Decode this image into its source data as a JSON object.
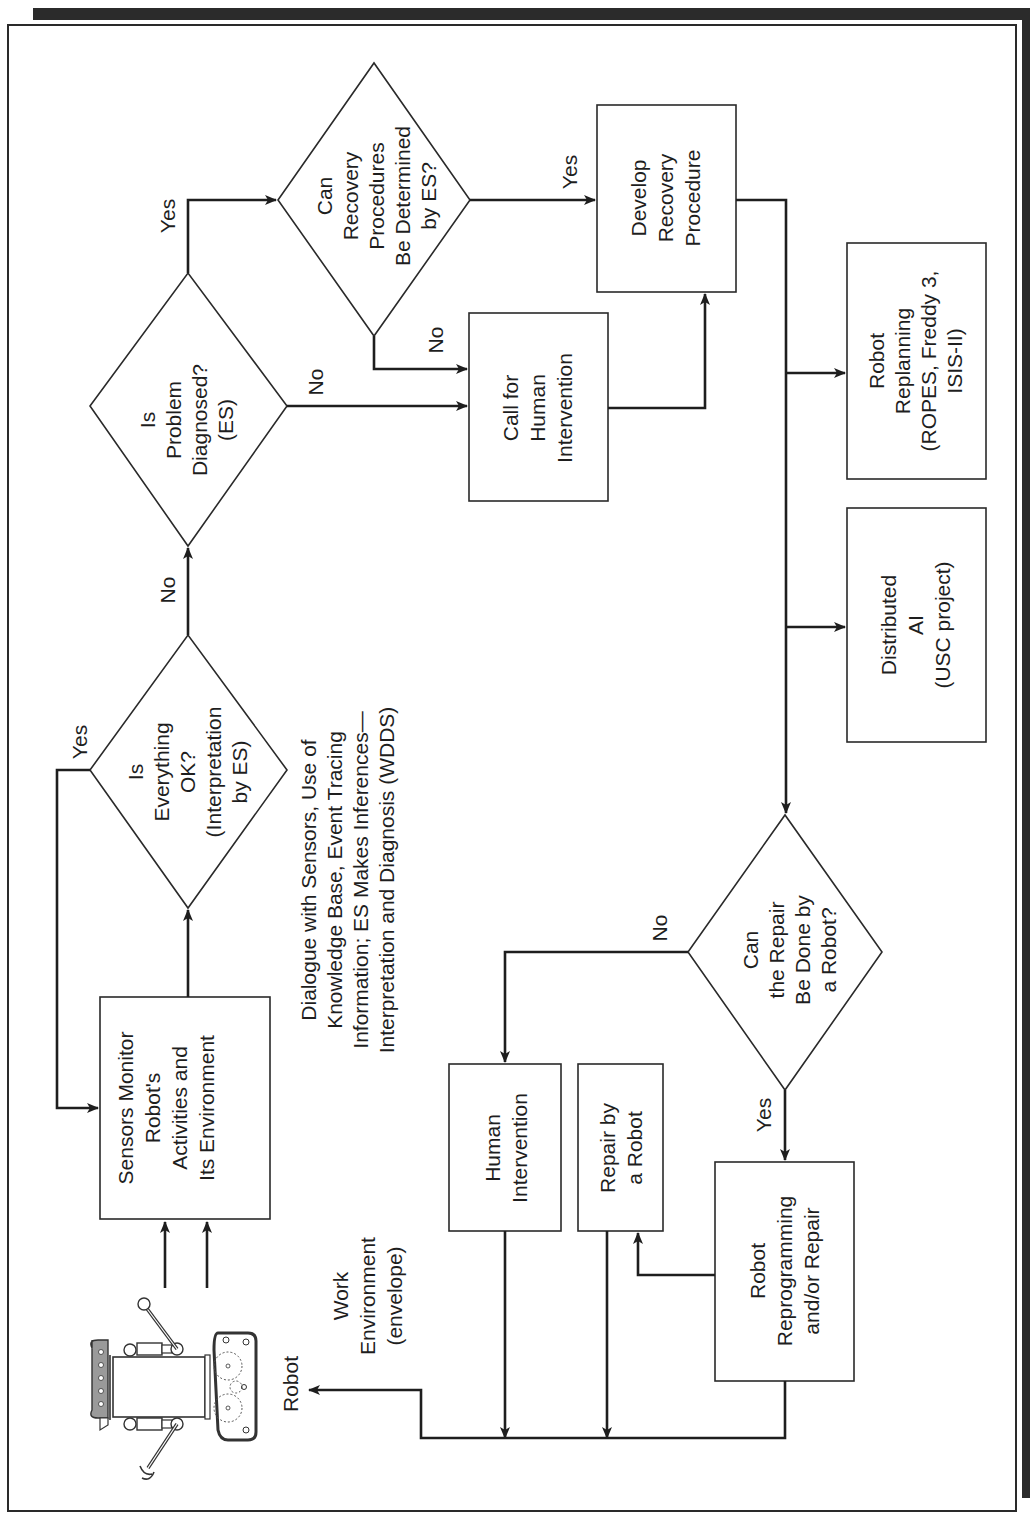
{
  "colors": {
    "ink": "#1e1e1e",
    "background": "#ffffff",
    "top_bar": "#2b2b2b",
    "robot_head": "#9a9a9a"
  },
  "orientation": "rotated 90 degrees counter-clockwise",
  "nodes": {
    "sensors": {
      "type": "process",
      "lines": [
        "Sensors Monitor",
        "Robot's",
        "Activities and",
        "Its Environment"
      ]
    },
    "everything_ok": {
      "type": "decision",
      "lines": [
        "Is",
        "Everything",
        "OK?",
        "(Interpretation",
        "by ES)"
      ]
    },
    "problem_diagnosed": {
      "type": "decision",
      "lines": [
        "Is",
        "Problem",
        "Diagnosed?",
        "(ES)"
      ]
    },
    "recovery_determined": {
      "type": "decision",
      "lines": [
        "Can",
        "Recovery",
        "Procedures",
        "Be Determined",
        "by ES?"
      ]
    },
    "call_human": {
      "type": "process",
      "lines": [
        "Call for",
        "Human",
        "Intervention"
      ]
    },
    "develop_recovery": {
      "type": "process",
      "lines": [
        "Develop",
        "Recovery",
        "Procedure"
      ]
    },
    "robot_replanning": {
      "type": "process",
      "lines": [
        "Robot",
        "Replanning",
        "(ROPES, Freddy 3,",
        "ISIS-II)"
      ]
    },
    "distributed_ai": {
      "type": "process",
      "lines": [
        "Distributed",
        "AI",
        "(USC project)"
      ]
    },
    "repair_by_robot_q": {
      "type": "decision",
      "lines": [
        "Can",
        "the Repair",
        "Be Done by",
        "a Robot?"
      ]
    },
    "human_intervention": {
      "type": "process",
      "lines": [
        "Human",
        "Intervention"
      ]
    },
    "repair_by_robot": {
      "type": "process",
      "lines": [
        "Repair by",
        "a Robot"
      ]
    },
    "robot_reprogramming": {
      "type": "process",
      "lines": [
        "Robot",
        "Reprogramming",
        "and/or Repair"
      ]
    }
  },
  "annotations": {
    "dialogue": [
      "Dialogue with Sensors, Use of",
      "Knowledge Base, Event Tracing",
      "Information; ES Makes Inferences—",
      "Interpretation and Diagnosis (WDDS)"
    ],
    "work_environment": [
      "Work",
      "Environment",
      "(envelope)"
    ],
    "robot": "Robot"
  },
  "edge_labels": {
    "ok_yes": "Yes",
    "ok_no": "No",
    "diag_yes": "Yes",
    "diag_no": "No",
    "recovery_yes": "Yes",
    "recovery_no": "No",
    "repair_no": "No",
    "repair_yes": "Yes"
  },
  "edges": [
    {
      "from": "robot",
      "to": "sensors"
    },
    {
      "from": "sensors",
      "to": "everything_ok"
    },
    {
      "from": "everything_ok",
      "to": "sensors",
      "label": "Yes"
    },
    {
      "from": "everything_ok",
      "to": "problem_diagnosed",
      "label": "No"
    },
    {
      "from": "problem_diagnosed",
      "to": "recovery_determined",
      "label": "Yes"
    },
    {
      "from": "problem_diagnosed",
      "to": "call_human",
      "label": "No"
    },
    {
      "from": "recovery_determined",
      "to": "develop_recovery",
      "label": "Yes"
    },
    {
      "from": "recovery_determined",
      "to": "call_human",
      "label": "No"
    },
    {
      "from": "call_human",
      "to": "develop_recovery"
    },
    {
      "from": "develop_recovery",
      "to": "robot_replanning"
    },
    {
      "from": "develop_recovery",
      "to": "distributed_ai"
    },
    {
      "from": "develop_recovery",
      "to": "repair_by_robot_q"
    },
    {
      "from": "repair_by_robot_q",
      "to": "human_intervention",
      "label": "No"
    },
    {
      "from": "repair_by_robot_q",
      "to": "robot_reprogramming",
      "label": "Yes"
    },
    {
      "from": "robot_reprogramming",
      "to": "repair_by_robot"
    },
    {
      "from": "human_intervention",
      "to": "robot"
    },
    {
      "from": "repair_by_robot",
      "to": "robot"
    },
    {
      "from": "robot_reprogramming",
      "to": "robot"
    }
  ]
}
